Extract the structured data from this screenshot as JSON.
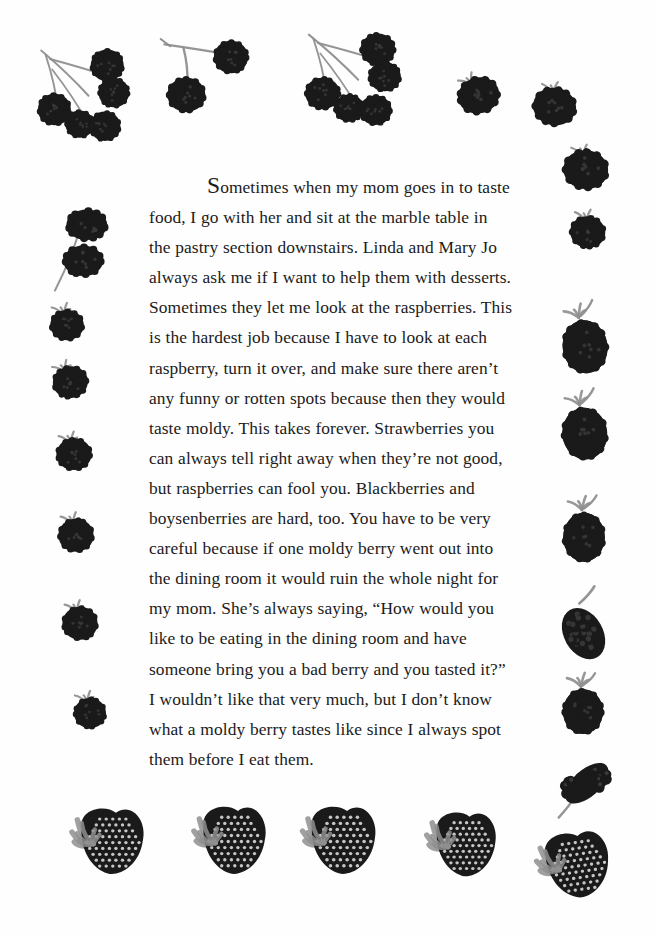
{
  "page": {
    "background_color": "#ffffff",
    "text_color": "#1b1b1b",
    "berry_dark": "#1a1a1a",
    "berry_mid": "#3a3a3a",
    "stem_gray": "#8f8f8f",
    "width": 655,
    "height": 934
  },
  "body": {
    "dropcap": "S",
    "paragraph": "ometimes when my mom goes in to taste food, I go with her and sit at the marble table in the pastry section downstairs. Linda and Mary Jo always ask me if I want to help them with desserts. Sometimes they let me look at the raspberries. This is the hardest job because I have to look at each raspberry, turn it over, and make sure there aren’t any funny or rotten spots because then they would taste moldy. This takes forever. Strawberries you can always tell right away when they’re not good, but raspberries can fool you. Blackberries and boysenberries are hard, too. You have to be very careful because if one moldy berry went out into the dining room it would ruin the whole night for my mom. She’s always saying, “How would you like to be eating in the dining room and have someone bring you a bad berry and you tasted it?” I wouldn’t like that very much, but I don’t know what a moldy berry tastes like since I always spot them before I eat them.",
    "lines": [
      "Sometimes when my mom goes in to",
      "taste food, I go with her and sit at the marble",
      "table in the pastry section downstairs. Linda",
      "and Mary Jo always ask me if I want to help",
      "them with desserts. Sometimes they let me look",
      "at the raspberries. This is the hardest job",
      "because I have to look at each raspberry, turn it",
      "over, and make sure there aren’t any funny or",
      "rotten spots because then they would taste",
      "moldy. This takes forever. Strawberries you can",
      "always tell right away when they’re not good,",
      "but raspberries can fool you. Blackberries and",
      "boysenberries are hard, too. You have to be very",
      "careful because if one moldy berry went out",
      "into the dining room it would ruin the whole",
      "night for my mom. She’s always saying, “How",
      "would you like to be eating in the dining room",
      "and have someone bring you a bad berry and",
      "you tasted it?” I wouldn’t like that very much,",
      "but I don’t know what a moldy berry tastes like",
      "since I always spot them before I eat them."
    ]
  },
  "decorations": {
    "description": "hand-painted berry illustrations forming a border",
    "items": [
      {
        "id": "berry-cluster-top-left",
        "kind": "raspberry-cluster",
        "x": 28,
        "y": 38,
        "w": 110,
        "h": 105,
        "rot": 0,
        "berries": 5
      },
      {
        "id": "berry-sprig-top-center-left",
        "kind": "raspberry-sprig",
        "x": 155,
        "y": 30,
        "w": 95,
        "h": 90,
        "rot": 0,
        "berries": 2
      },
      {
        "id": "berry-cluster-top-center",
        "kind": "raspberry-cluster",
        "x": 295,
        "y": 22,
        "w": 115,
        "h": 105,
        "rot": 0,
        "berries": 5
      },
      {
        "id": "berry-top-right-a",
        "kind": "raspberry-single",
        "x": 452,
        "y": 68,
        "w": 52,
        "h": 50,
        "rot": -15,
        "berries": 1
      },
      {
        "id": "berry-top-right-b",
        "kind": "raspberry-single",
        "x": 528,
        "y": 78,
        "w": 54,
        "h": 52,
        "rot": 10,
        "berries": 1
      },
      {
        "id": "berry-top-right-c",
        "kind": "raspberry-single",
        "x": 558,
        "y": 140,
        "w": 56,
        "h": 54,
        "rot": 5,
        "berries": 1
      },
      {
        "id": "berry-right-1",
        "kind": "raspberry-single",
        "x": 566,
        "y": 208,
        "w": 44,
        "h": 44,
        "rot": 8,
        "berries": 1
      },
      {
        "id": "berry-right-2",
        "kind": "blackberry-large",
        "x": 556,
        "y": 300,
        "w": 56,
        "h": 78,
        "rot": -8,
        "berries": 1
      },
      {
        "id": "berry-right-3",
        "kind": "blackberry-large",
        "x": 556,
        "y": 388,
        "w": 56,
        "h": 76,
        "rot": -6,
        "berries": 1
      },
      {
        "id": "berry-right-4",
        "kind": "blackberry-large",
        "x": 558,
        "y": 494,
        "w": 52,
        "h": 72,
        "rot": 0,
        "berries": 1
      },
      {
        "id": "berry-right-5",
        "kind": "blackberry-drupe",
        "x": 556,
        "y": 588,
        "w": 54,
        "h": 76,
        "rot": -12,
        "berries": 1
      },
      {
        "id": "berry-right-6",
        "kind": "blackberry-large",
        "x": 558,
        "y": 672,
        "w": 50,
        "h": 66,
        "rot": 0,
        "berries": 1
      },
      {
        "id": "berry-right-7",
        "kind": "mulberry-long",
        "x": 548,
        "y": 760,
        "w": 72,
        "h": 56,
        "rot": -22,
        "berries": 1
      },
      {
        "id": "berry-left-1",
        "kind": "raspberry-pair",
        "x": 52,
        "y": 205,
        "w": 60,
        "h": 90,
        "rot": 0,
        "berries": 2
      },
      {
        "id": "berry-left-2",
        "kind": "raspberry-single",
        "x": 46,
        "y": 302,
        "w": 42,
        "h": 42,
        "rot": 0,
        "berries": 1
      },
      {
        "id": "berry-left-3",
        "kind": "raspberry-single",
        "x": 48,
        "y": 358,
        "w": 44,
        "h": 44,
        "rot": -10,
        "berries": 1
      },
      {
        "id": "berry-left-4",
        "kind": "raspberry-single",
        "x": 52,
        "y": 430,
        "w": 44,
        "h": 44,
        "rot": 0,
        "berries": 1
      },
      {
        "id": "berry-left-5",
        "kind": "raspberry-single",
        "x": 54,
        "y": 510,
        "w": 44,
        "h": 46,
        "rot": 0,
        "berries": 1
      },
      {
        "id": "berry-left-6",
        "kind": "raspberry-single",
        "x": 58,
        "y": 598,
        "w": 44,
        "h": 46,
        "rot": 0,
        "berries": 1
      },
      {
        "id": "berry-left-7",
        "kind": "raspberry-single",
        "x": 70,
        "y": 690,
        "w": 40,
        "h": 42,
        "rot": 0,
        "berries": 1
      },
      {
        "id": "berry-bottom-1",
        "kind": "strawberry-shape",
        "x": 68,
        "y": 808,
        "w": 80,
        "h": 72,
        "rot": 0,
        "berries": 1
      },
      {
        "id": "berry-bottom-2",
        "kind": "strawberry-shape",
        "x": 190,
        "y": 806,
        "w": 80,
        "h": 74,
        "rot": 0,
        "berries": 1
      },
      {
        "id": "berry-bottom-3",
        "kind": "strawberry-shape",
        "x": 298,
        "y": 806,
        "w": 82,
        "h": 74,
        "rot": 0,
        "berries": 1
      },
      {
        "id": "berry-bottom-4",
        "kind": "strawberry-shape",
        "x": 424,
        "y": 812,
        "w": 76,
        "h": 70,
        "rot": 0,
        "berries": 1
      },
      {
        "id": "berry-bottom-5",
        "kind": "strawberry-shape",
        "x": 534,
        "y": 832,
        "w": 80,
        "h": 72,
        "rot": -8,
        "berries": 1
      }
    ]
  }
}
